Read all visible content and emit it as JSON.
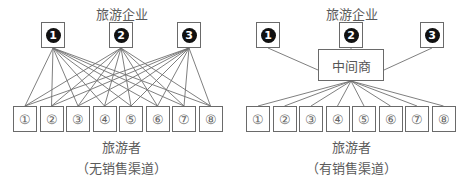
{
  "left_panel": {
    "top_label": "旅游企业",
    "enterprises": [
      "1",
      "2",
      "3"
    ],
    "tourists": [
      "①",
      "②",
      "③",
      "④",
      "⑤",
      "⑥",
      "⑦",
      "⑧"
    ],
    "bottom_label": "旅游者",
    "caption": "（无销售渠道）"
  },
  "right_panel": {
    "top_label": "旅游企业",
    "enterprises": [
      "1",
      "2",
      "3"
    ],
    "intermediary": "中间商",
    "tourists": [
      "①",
      "②",
      "③",
      "④",
      "⑤",
      "⑥",
      "⑦",
      "⑧"
    ],
    "bottom_label": "旅游者",
    "caption": "（有销售渠道）"
  },
  "colors": {
    "line": "#6a6a6a",
    "dot": "#111111",
    "text": "#555555"
  }
}
